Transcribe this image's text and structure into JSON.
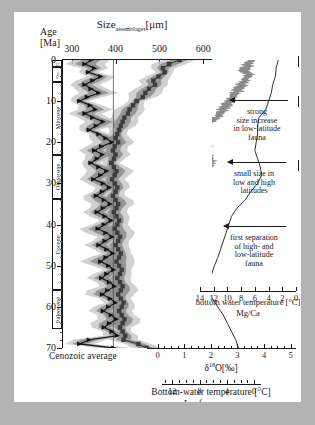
{
  "figure": {
    "title": "Size",
    "title_sub": "assemblages",
    "title_unit": "[μm]",
    "age_label": "Age",
    "age_unit": "[Ma]",
    "cenozoic_label": "Cenozoic average",
    "background": "#b3b3b3",
    "panel_background": "#ffffff",
    "ink": "#1a1a1a",
    "band_dark": "#8c8c8c",
    "band_light": "#c9c9c9"
  },
  "size_axis": {
    "label": "Size assemblages",
    "unit": "[μm]",
    "ticks": [
      300,
      400,
      500,
      600
    ],
    "min": 280,
    "max": 620
  },
  "age_axis": {
    "unit": "[Ma]",
    "ticks": [
      0,
      10,
      20,
      30,
      40,
      50,
      60,
      70
    ],
    "minor_step": 2,
    "min": 0,
    "max": 70
  },
  "epochs": [
    {
      "name": "Pl.",
      "short": "Pl.",
      "from": 0,
      "to": 1.8,
      "tiny": true
    },
    {
      "name": "Plio.",
      "short": "Plio.",
      "from": 1.8,
      "to": 5.3,
      "tiny": true
    },
    {
      "name": "Miocene",
      "short": "Miocene",
      "from": 5.3,
      "to": 23.0,
      "tiny": false
    },
    {
      "name": "Oligocene",
      "short": "Oligocene",
      "from": 23.0,
      "to": 33.9,
      "tiny": false
    },
    {
      "name": "Eocene",
      "short": "Eocene",
      "from": 33.9,
      "to": 55.8,
      "tiny": false
    },
    {
      "name": "Paleocene",
      "short": "Paleocene",
      "from": 55.8,
      "to": 65.5,
      "tiny": false
    }
  ],
  "mgca_axis": {
    "label": "bottom water temperature [°C]",
    "sublabel": "Mg/Ca",
    "ticks": [
      14,
      12,
      10,
      8,
      6,
      4,
      2,
      0
    ],
    "min": 14,
    "max": 0,
    "reversed": true
  },
  "d18o_axis": {
    "label": "δ",
    "label_sup": "18",
    "label_rest": "O[‰]",
    "ticks": [
      0,
      1,
      2,
      3,
      4,
      5
    ],
    "min": -0.4,
    "max": 5.2
  },
  "temp_axis": {
    "label": "Bottom-water temperature [°C]",
    "sublabel": "Ice-free ocean",
    "ticks": [
      12,
      8,
      4,
      0
    ],
    "min": 13.5,
    "max": -1.0,
    "reversed": true
  },
  "annotations": [
    {
      "id": "strong-size-increase",
      "lines": [
        "strong",
        "size increase",
        "in low-latitude",
        "fauna"
      ],
      "age_ma": 5.0
    },
    {
      "id": "small-size",
      "lines": [
        "small size in",
        "low and high",
        "latitudes"
      ],
      "age_ma": 28.0
    },
    {
      "id": "first-separation",
      "lines": [
        "first separation",
        "of high- and",
        "low-latitude",
        "fauna"
      ],
      "age_ma": 47.0
    }
  ],
  "chart_data": {
    "type": "line",
    "xlabel": "Size assemblages [μm]",
    "ylabel": "Age [Ma]",
    "xlim": [
      280,
      620
    ],
    "ylim": [
      70,
      0
    ],
    "grid": false,
    "legend": "none",
    "series": [
      {
        "name": "high-latitude assemblage size",
        "marker": "triangle",
        "color": "#111111",
        "x": [
          345,
          330,
          352,
          338,
          366,
          348,
          330,
          344,
          362,
          336,
          318,
          342,
          354,
          330,
          348,
          372,
          356,
          340,
          362,
          378,
          392,
          368,
          352,
          370,
          358,
          344,
          362,
          380,
          366,
          350,
          372,
          386,
          370,
          356,
          374,
          388,
          372,
          358,
          376,
          390,
          374,
          360,
          378,
          392,
          376,
          362,
          380,
          394,
          378,
          366,
          384,
          396,
          380,
          368,
          386,
          398,
          382,
          370,
          388,
          400,
          384,
          372,
          390,
          402,
          386,
          374,
          392,
          404,
          340,
          318,
          396
        ],
        "y": [
          0,
          1,
          2,
          3,
          4,
          5,
          6,
          7,
          8,
          9,
          10,
          11,
          12,
          13,
          14,
          15,
          16,
          17,
          18,
          19,
          20,
          21,
          22,
          23,
          24,
          25,
          26,
          27,
          28,
          29,
          30,
          31,
          32,
          33,
          34,
          35,
          36,
          37,
          38,
          39,
          40,
          41,
          42,
          43,
          44,
          45,
          46,
          47,
          48,
          49,
          50,
          51,
          52,
          53,
          54,
          55,
          56,
          57,
          58,
          59,
          60,
          61,
          62,
          63,
          64,
          65,
          66,
          67,
          68,
          69,
          70
        ]
      },
      {
        "name": "low-latitude assemblage size",
        "marker": "square",
        "color": "#3c3c3c",
        "x": [
          546,
          522,
          508,
          512,
          498,
          486,
          490,
          476,
          468,
          462,
          448,
          440,
          432,
          428,
          420,
          416,
          412,
          408,
          404,
          400,
          406,
          398,
          394,
          400,
          396,
          390,
          396,
          402,
          398,
          392,
          398,
          404,
          400,
          394,
          400,
          406,
          402,
          396,
          402,
          408,
          404,
          398,
          404,
          410,
          406,
          400,
          406,
          412,
          408,
          402,
          408,
          414,
          410,
          404,
          410,
          416,
          412,
          406,
          412,
          418,
          414,
          408,
          414,
          420,
          416,
          410,
          416,
          422,
          418,
          452,
          470
        ],
        "y": [
          0,
          1,
          2,
          3,
          4,
          5,
          6,
          7,
          8,
          9,
          10,
          11,
          12,
          13,
          14,
          15,
          16,
          17,
          18,
          19,
          20,
          21,
          22,
          23,
          24,
          25,
          26,
          27,
          28,
          29,
          30,
          31,
          32,
          33,
          34,
          35,
          36,
          37,
          38,
          39,
          40,
          41,
          42,
          43,
          44,
          45,
          46,
          47,
          48,
          49,
          50,
          51,
          52,
          53,
          54,
          55,
          56,
          57,
          58,
          59,
          60,
          61,
          62,
          63,
          64,
          65,
          66,
          67,
          68,
          69,
          70
        ]
      }
    ],
    "reference_line": {
      "name": "Cenozoic average",
      "x": 395
    },
    "secondary_panels": [
      {
        "name": "δ18O benthic stack",
        "type": "area",
        "axis": "d18o_axis",
        "color": "#8c8c8c"
      },
      {
        "name": "Mg/Ca bottom water temperature",
        "type": "line",
        "axis": "mgca_axis",
        "color": "#1a1a1a"
      }
    ]
  }
}
